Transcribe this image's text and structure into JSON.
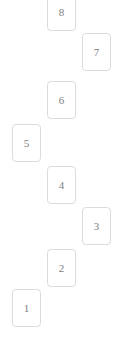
{
  "view": {
    "name": "numbered-card-staircase",
    "width": 121,
    "height": 348,
    "background_color": "#ffffff",
    "card": {
      "width": 29,
      "height": 38,
      "border_color": "#dcdcdc",
      "fill_color": "#ffffff",
      "corner_radius": 4,
      "label_color": "#808080"
    }
  },
  "cards": [
    {
      "label": "8",
      "x": 47,
      "y": -7,
      "column": "middle"
    },
    {
      "label": "7",
      "x": 82,
      "y": 33,
      "column": "right"
    },
    {
      "label": "6",
      "x": 47,
      "y": 81,
      "column": "middle"
    },
    {
      "label": "5",
      "x": 12,
      "y": 124,
      "column": "left"
    },
    {
      "label": "4",
      "x": 47,
      "y": 166,
      "column": "middle"
    },
    {
      "label": "3",
      "x": 82,
      "y": 207,
      "column": "right"
    },
    {
      "label": "2",
      "x": 47,
      "y": 249,
      "column": "middle"
    },
    {
      "label": "1",
      "x": 12,
      "y": 289,
      "column": "left"
    }
  ]
}
